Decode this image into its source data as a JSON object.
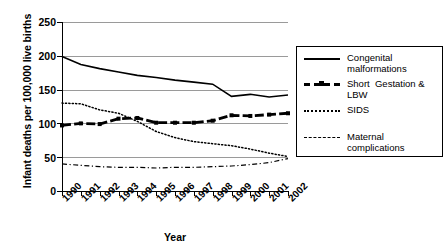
{
  "chart_data": {
    "type": "line",
    "title": "",
    "xlabel": "Year",
    "ylabel": "Infant deaths per 100,000 live births",
    "categories": [
      "1990",
      "1991",
      "1992",
      "1993",
      "1994",
      "1995",
      "1996",
      "1997",
      "1998",
      "1999",
      "2000",
      "2001",
      "2002"
    ],
    "ylim": [
      0,
      250
    ],
    "yticks": [
      0,
      50,
      100,
      150,
      200,
      250
    ],
    "grid": true,
    "legend_position": "right",
    "series": [
      {
        "name": "Congenital malformations",
        "style": "solid",
        "values": [
          199,
          187,
          181,
          176,
          171,
          168,
          164,
          161,
          158,
          140,
          143,
          139,
          142
        ]
      },
      {
        "name": "Short  Gestation & LBW",
        "style": "thick-dashed-marker",
        "values": [
          97,
          100,
          99,
          107,
          108,
          101,
          101,
          101,
          104,
          112,
          111,
          113,
          115
        ]
      },
      {
        "name": "SIDS",
        "style": "dotted",
        "values": [
          130,
          129,
          120,
          115,
          103,
          88,
          79,
          73,
          70,
          67,
          62,
          56,
          51
        ]
      },
      {
        "name": "Maternal complications",
        "style": "dash-dot",
        "values": [
          40,
          38,
          36,
          35,
          35,
          34,
          35,
          35,
          36,
          37,
          39,
          42,
          48
        ]
      }
    ]
  },
  "yticklabels": [
    "250",
    "200",
    "150",
    "100",
    "50",
    "0"
  ],
  "legend": {
    "items": [
      {
        "label": "Congenital\nmalformations",
        "icon": "solid-line-icon"
      },
      {
        "label": "Short  Gestation & LBW",
        "icon": "thick-dashed-square-marker-icon"
      },
      {
        "label": "SIDS",
        "icon": "dotted-line-icon"
      },
      {
        "label": "Maternal complications",
        "icon": "dash-dot-line-icon"
      }
    ]
  }
}
